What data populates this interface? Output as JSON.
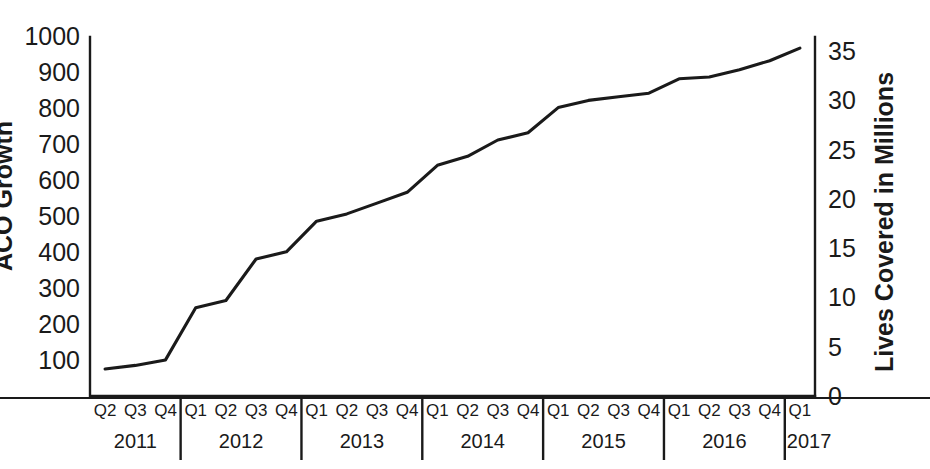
{
  "chart_data": {
    "type": "line",
    "title": "",
    "xlabel": "",
    "ylabel": "ACO Growth",
    "y2label": "Lives Covered in Millions",
    "grid": false,
    "legend": "none",
    "ylim": [
      0,
      1050
    ],
    "y2lim": [
      0,
      36.75
    ],
    "left_axis": {
      "label": "ACO Growth",
      "ticks": [
        "100",
        "200",
        "300",
        "400",
        "500",
        "600",
        "700",
        "800",
        "900",
        "1000"
      ],
      "tick_values": [
        100,
        200,
        300,
        400,
        500,
        600,
        700,
        800,
        900,
        1000
      ],
      "note": "left axis title is clipped at the left edge of the screenshot"
    },
    "right_axis": {
      "label": "Lives Covered in Millions",
      "ticks": [
        "0",
        "5",
        "10",
        "15",
        "20",
        "25",
        "30",
        "35"
      ],
      "tick_values": [
        0,
        5,
        10,
        15,
        20,
        25,
        30,
        35
      ]
    },
    "years": [
      {
        "year": "2011",
        "quarters": [
          "Q2",
          "Q3",
          "Q4"
        ]
      },
      {
        "year": "2012",
        "quarters": [
          "Q1",
          "Q2",
          "Q3",
          "Q4"
        ]
      },
      {
        "year": "2013",
        "quarters": [
          "Q1",
          "Q2",
          "Q3",
          "Q4"
        ]
      },
      {
        "year": "2014",
        "quarters": [
          "Q1",
          "Q2",
          "Q3",
          "Q4"
        ]
      },
      {
        "year": "2015",
        "quarters": [
          "Q1",
          "Q2",
          "Q3",
          "Q4"
        ]
      },
      {
        "year": "2016",
        "quarters": [
          "Q1",
          "Q2",
          "Q3",
          "Q4"
        ]
      },
      {
        "year": "2017",
        "quarters": [
          "Q1"
        ]
      }
    ],
    "categories": [
      "Q2 2011",
      "Q3 2011",
      "Q4 2011",
      "Q1 2012",
      "Q2 2012",
      "Q3 2012",
      "Q4 2012",
      "Q1 2013",
      "Q2 2013",
      "Q3 2013",
      "Q4 2013",
      "Q1 2014",
      "Q2 2014",
      "Q3 2014",
      "Q4 2014",
      "Q1 2015",
      "Q2 2015",
      "Q3 2015",
      "Q4 2015",
      "Q1 2016",
      "Q2 2016",
      "Q3 2016",
      "Q4 2016",
      "Q1 2017"
    ],
    "series": [
      {
        "name": "ACO Growth",
        "axis": "left",
        "values": [
          75,
          85,
          100,
          245,
          265,
          380,
          400,
          485,
          505,
          535,
          565,
          640,
          665,
          710,
          730,
          800,
          820,
          830,
          840,
          880,
          885,
          905,
          930,
          965
        ]
      }
    ]
  },
  "colors": {
    "line": "#1a1a1a",
    "axis": "#1a1a1a",
    "background": "#ffffff"
  }
}
